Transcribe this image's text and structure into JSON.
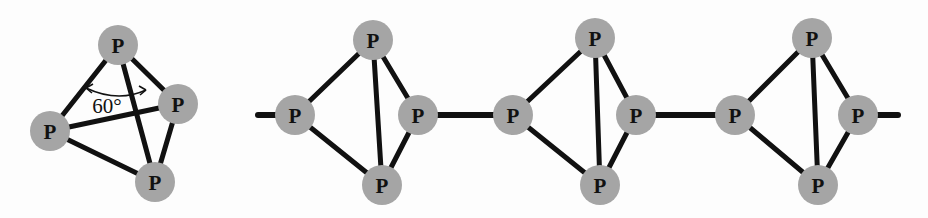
{
  "figure": {
    "background_color": "#fdfdfd",
    "atom_color": "#a5a5a5",
    "bond_color": "#111111",
    "atom_label": "P",
    "atom_radius": 19,
    "bond_width": 5,
    "link_bond_width": 6
  },
  "annotation": {
    "angle_text": "60°"
  },
  "structures": [
    {
      "name": "p4-tetrahedron",
      "atoms": [
        {
          "id": "t1-top",
          "label": "P",
          "cx": 118,
          "cy": 45,
          "r": 20
        },
        {
          "id": "t1-left",
          "label": "P",
          "cx": 50,
          "cy": 131,
          "r": 20
        },
        {
          "id": "t1-right",
          "label": "P",
          "cx": 178,
          "cy": 104,
          "r": 20
        },
        {
          "id": "t1-bottom",
          "label": "P",
          "cx": 155,
          "cy": 182,
          "r": 20
        }
      ],
      "bonds": [
        {
          "from": "t1-top",
          "to": "t1-left",
          "width": 5
        },
        {
          "from": "t1-top",
          "to": "t1-right",
          "width": 5
        },
        {
          "from": "t1-top",
          "to": "t1-bottom",
          "width": 5
        },
        {
          "from": "t1-left",
          "to": "t1-right",
          "width": 5
        },
        {
          "from": "t1-left",
          "to": "t1-bottom",
          "width": 5
        },
        {
          "from": "t1-right",
          "to": "t1-bottom",
          "width": 5
        }
      ],
      "angle_marker": {
        "label": "60°",
        "label_x": 107,
        "label_y": 106,
        "arc_path": "M 86 88 Q 118 103 146 90",
        "arrow_left": "M 86 88 L 93 84 M 86 88 L 92 93",
        "arrow_right": "M 146 90 L 139 86 M 146 90 L 140 95"
      }
    },
    {
      "name": "chain-unit-1",
      "atoms": [
        {
          "id": "c1-top",
          "label": "P",
          "cx": 373,
          "cy": 40,
          "r": 20
        },
        {
          "id": "c1-left",
          "label": "P",
          "cx": 295,
          "cy": 115,
          "r": 20
        },
        {
          "id": "c1-right",
          "label": "P",
          "cx": 418,
          "cy": 115,
          "r": 20
        },
        {
          "id": "c1-bottom",
          "label": "P",
          "cx": 382,
          "cy": 185,
          "r": 20
        }
      ],
      "bonds": [
        {
          "from": "c1-top",
          "to": "c1-left",
          "width": 5
        },
        {
          "from": "c1-top",
          "to": "c1-right",
          "width": 5
        },
        {
          "from": "c1-top",
          "to": "c1-bottom",
          "width": 5
        },
        {
          "from": "c1-left",
          "to": "c1-bottom",
          "width": 5
        },
        {
          "from": "c1-right",
          "to": "c1-bottom",
          "width": 5
        }
      ]
    },
    {
      "name": "chain-unit-2",
      "atoms": [
        {
          "id": "c2-top",
          "label": "P",
          "cx": 595,
          "cy": 38,
          "r": 20
        },
        {
          "id": "c2-left",
          "label": "P",
          "cx": 513,
          "cy": 115,
          "r": 20
        },
        {
          "id": "c2-right",
          "label": "P",
          "cx": 636,
          "cy": 115,
          "r": 20
        },
        {
          "id": "c2-bottom",
          "label": "P",
          "cx": 600,
          "cy": 185,
          "r": 20
        }
      ],
      "bonds": [
        {
          "from": "c2-top",
          "to": "c2-left",
          "width": 5
        },
        {
          "from": "c2-top",
          "to": "c2-right",
          "width": 5
        },
        {
          "from": "c2-top",
          "to": "c2-bottom",
          "width": 5
        },
        {
          "from": "c2-left",
          "to": "c2-bottom",
          "width": 5
        },
        {
          "from": "c2-right",
          "to": "c2-bottom",
          "width": 5
        }
      ]
    },
    {
      "name": "chain-unit-3",
      "atoms": [
        {
          "id": "c3-top",
          "label": "P",
          "cx": 812,
          "cy": 38,
          "r": 20
        },
        {
          "id": "c3-left",
          "label": "P",
          "cx": 735,
          "cy": 115,
          "r": 20
        },
        {
          "id": "c3-right",
          "label": "P",
          "cx": 858,
          "cy": 115,
          "r": 20
        },
        {
          "id": "c3-bottom",
          "label": "P",
          "cx": 818,
          "cy": 185,
          "r": 20
        }
      ],
      "bonds": [
        {
          "from": "c3-top",
          "to": "c3-left",
          "width": 5
        },
        {
          "from": "c3-top",
          "to": "c3-right",
          "width": 5
        },
        {
          "from": "c3-top",
          "to": "c3-bottom",
          "width": 5
        },
        {
          "from": "c3-left",
          "to": "c3-bottom",
          "width": 5
        },
        {
          "from": "c3-right",
          "to": "c3-bottom",
          "width": 5
        }
      ]
    }
  ],
  "linker_bonds": [
    {
      "name": "chain-terminal-left",
      "x1": 258,
      "y1": 115,
      "x2": 295,
      "y2": 115,
      "width": 6
    },
    {
      "name": "chain-link-1-2",
      "x1": 418,
      "y1": 115,
      "x2": 513,
      "y2": 115,
      "width": 6
    },
    {
      "name": "chain-link-2-3",
      "x1": 636,
      "y1": 115,
      "x2": 735,
      "y2": 115,
      "width": 6
    },
    {
      "name": "chain-terminal-right",
      "x1": 858,
      "y1": 115,
      "x2": 898,
      "y2": 115,
      "width": 6
    }
  ]
}
